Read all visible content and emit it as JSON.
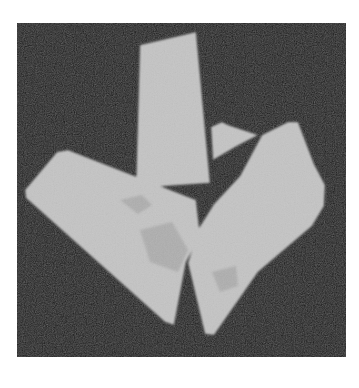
{
  "image": {
    "width": 359,
    "height": 388,
    "page_background": "#ffffff",
    "panel": {
      "x": 17,
      "y": 23,
      "w": 329,
      "h": 334,
      "color": "#1e1e1e"
    },
    "fragment_color": "#c4c4c4",
    "fragment_shade_color": "#a9a9a9",
    "fragments": [
      {
        "name": "tall-fragment",
        "points": "140,45 196,32 210,183 136,188"
      },
      {
        "name": "small-fragment",
        "points": "211,127 222,122 228,125 258,135 237,146 213,160"
      },
      {
        "name": "left-fragment",
        "points": "57,152 68,150 196,200 200,236 186,262 174,325 165,322 26,198 25,190"
      },
      {
        "name": "right-fragment",
        "points": "262,135 288,122 298,122 314,164 325,185 324,206 312,226 258,272 214,335 205,334 188,263 199,228 214,204 240,176"
      }
    ],
    "shades": [
      {
        "name": "shade-left-1",
        "points": "120,200 142,195 152,205 138,214"
      },
      {
        "name": "shade-left-2",
        "points": "140,230 172,222 188,250 178,272 150,262"
      },
      {
        "name": "shade-right-1",
        "points": "212,272 236,266 238,286 220,292"
      }
    ]
  }
}
